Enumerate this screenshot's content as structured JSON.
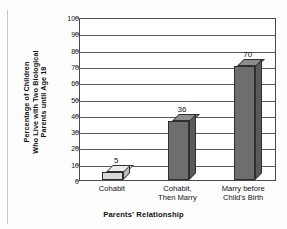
{
  "chart_data": {
    "type": "bar",
    "title": "",
    "xlabel": "Parents' Relationship",
    "ylabel": "Percentage of Children Who Live with Two Biological Parents until Age 18",
    "ylabel_lines": [
      "Percentage of Children",
      "Who Live with Two Biological",
      "Parents until Age 18"
    ],
    "categories": [
      "Cohabit",
      "Cohabit, Then Marry",
      "Marry before Child's Birth"
    ],
    "category_lines": [
      [
        "Cohabit"
      ],
      [
        "Cohabit,",
        "Then Marry"
      ],
      [
        "Marry before",
        "Child's Birth"
      ]
    ],
    "values": [
      5,
      36,
      70
    ],
    "data_labels": [
      "5",
      "36",
      "70"
    ],
    "ylim": [
      0,
      100
    ],
    "ytick_step": 10,
    "yticks": [
      100,
      90,
      80,
      70,
      60,
      50,
      40,
      30,
      20,
      10,
      0
    ],
    "ytick_labels": [
      "100",
      "90",
      "80",
      "70",
      "60",
      "50",
      "40",
      "30",
      "20",
      "10",
      "0"
    ],
    "grid": true,
    "legend": "none",
    "style": "3d-bar",
    "colors": {
      "bar_front_dark": "#6e6e6e",
      "bar_top_dark": "#8d8d8d",
      "bar_side_dark": "#5a5a5a",
      "bar_front_light": "#d8d8d8",
      "bar_top_light": "#ececec",
      "bar_side_light": "#bcbcbc",
      "axis": "#4a4a4a",
      "grid": "#5a5a5a",
      "text": "#111111",
      "background": "#ffffff"
    }
  }
}
